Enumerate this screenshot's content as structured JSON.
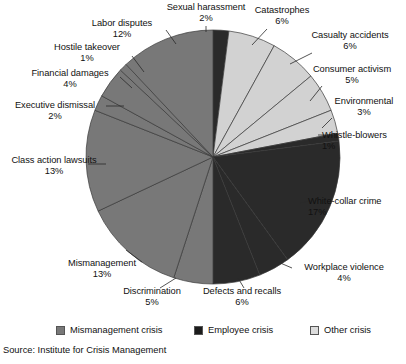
{
  "chart_data": {
    "type": "pie",
    "title": "",
    "xlabel": "",
    "ylabel": "",
    "start_angle_deg": 0,
    "direction": "clockwise",
    "legend_position": "bottom",
    "grid": false,
    "categories": [
      "Sexual harassment",
      "Catastrophes",
      "Casualty accidents",
      "Consumer activism",
      "Environmental",
      "Whistle-blowers",
      "White-collar crime",
      "Workplace violence",
      "Defects and recalls",
      "Discrimination",
      "Mismanagement",
      "Class action lawsuits",
      "Executive dismissal",
      "Financial damages",
      "Hostile takeover",
      "Labor disputes"
    ],
    "values": [
      2,
      6,
      6,
      5,
      3,
      1,
      17,
      4,
      6,
      5,
      13,
      13,
      2,
      4,
      1,
      12
    ],
    "value_labels": [
      "2%",
      "6%",
      "6%",
      "5%",
      "3%",
      "1%",
      "17%",
      "4%",
      "6%",
      "5%",
      "13%",
      "13%",
      "2%",
      "4%",
      "1%",
      "12%"
    ],
    "groups": [
      "employee",
      "other",
      "other",
      "other",
      "other",
      "employee",
      "employee",
      "employee",
      "employee",
      "mismanagement",
      "mismanagement",
      "mismanagement",
      "mismanagement",
      "mismanagement",
      "mismanagement",
      "mismanagement"
    ],
    "group_colors": {
      "mismanagement": "#787878",
      "employee": "#2a2a2a",
      "other": "#d2d2d2"
    },
    "legend": [
      {
        "label": "Mismanagement crisis",
        "color": "#787878"
      },
      {
        "label": "Employee crisis",
        "color": "#1c1c1c"
      },
      {
        "label": "Other crisis",
        "color": "#dcdcdc"
      }
    ],
    "source": "Source: Institute for Crisis Management"
  },
  "labels": [
    {
      "name": "Sexual harassment",
      "pct": "2%",
      "x": 158,
      "y": 2,
      "align": "ta-c",
      "w": 96,
      "lx1": 206,
      "ly1": 26,
      "lx2": 206,
      "ly2": 32
    },
    {
      "name": "Catastrophes",
      "pct": "6%",
      "x": 246,
      "y": 5,
      "align": "ta-c",
      "w": 72,
      "lx1": 267,
      "ly1": 29,
      "lx2": 252,
      "ly2": 45
    },
    {
      "name": "Casualty accidents",
      "pct": "6%",
      "x": 300,
      "y": 30,
      "align": "ta-c",
      "w": 100,
      "lx1": 312,
      "ly1": 53,
      "lx2": 290,
      "ly2": 64
    },
    {
      "name": "Consumer activism",
      "pct": "5%",
      "x": 302,
      "y": 64,
      "align": "ta-c",
      "w": 100,
      "lx1": 322,
      "ly1": 86,
      "lx2": 310,
      "ly2": 101
    },
    {
      "name": "Environmental",
      "pct": "3%",
      "x": 326,
      "y": 96,
      "align": "ta-c",
      "w": 76,
      "lx1": 332,
      "ly1": 118,
      "lx2": 322,
      "ly2": 128
    },
    {
      "name": "Whistle-blowers",
      "pct": "1%",
      "x": 322,
      "y": 130,
      "align": "ta-l",
      "w": 84,
      "lx1": 318,
      "ly1": 135,
      "lx2": 332,
      "ly2": 135
    },
    {
      "name": "White-collar crime",
      "pct": "17%",
      "x": 308,
      "y": 196,
      "align": "ta-l",
      "w": 98,
      "lx1": 300,
      "ly1": 203,
      "lx2": 314,
      "ly2": 200
    },
    {
      "name": "Workplace violence",
      "pct": "4%",
      "x": 288,
      "y": 262,
      "align": "ta-c",
      "w": 112,
      "lx1": 278,
      "ly1": 262,
      "lx2": 292,
      "ly2": 268
    },
    {
      "name": "Defects and recalls",
      "pct": "6%",
      "x": 192,
      "y": 286,
      "align": "ta-c",
      "w": 100,
      "lx1": 238,
      "ly1": 278,
      "lx2": 244,
      "ly2": 288
    },
    {
      "name": "Discrimination",
      "pct": "5%",
      "x": 113,
      "y": 286,
      "align": "ta-c",
      "w": 78,
      "lx1": 176,
      "ly1": 278,
      "lx2": 160,
      "ly2": 288
    },
    {
      "name": "Mismanagement",
      "pct": "13%",
      "x": 58,
      "y": 258,
      "align": "ta-c",
      "w": 88,
      "lx1": 126,
      "ly1": 250,
      "lx2": 142,
      "ly2": 262
    },
    {
      "name": "Class action lawsuits",
      "pct": "13%",
      "x": 2,
      "y": 155,
      "align": "ta-c",
      "w": 104,
      "lx1": 88,
      "ly1": 164,
      "lx2": 106,
      "ly2": 164
    },
    {
      "name": "Executive dismissal",
      "pct": "2%",
      "x": 4,
      "y": 100,
      "align": "ta-c",
      "w": 102,
      "lx1": 106,
      "ly1": 106,
      "lx2": 124,
      "ly2": 106
    },
    {
      "name": "Financial damages",
      "pct": "4%",
      "x": 22,
      "y": 68,
      "align": "ta-c",
      "w": 96,
      "lx1": 120,
      "ly1": 77,
      "lx2": 132,
      "ly2": 88
    },
    {
      "name": "Hostile takeover",
      "pct": "1%",
      "x": 44,
      "y": 42,
      "align": "ta-c",
      "w": 86,
      "lx1": 132,
      "ly1": 56,
      "lx2": 144,
      "ly2": 72
    },
    {
      "name": "Labor disputes",
      "pct": "12%",
      "x": 80,
      "y": 18,
      "align": "ta-c",
      "w": 84,
      "lx1": 166,
      "ly1": 30,
      "lx2": 176,
      "ly2": 44
    }
  ],
  "legend_layout": [
    {
      "x": 56
    },
    {
      "x": 194
    },
    {
      "x": 310
    }
  ]
}
